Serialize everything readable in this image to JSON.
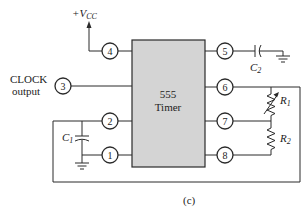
{
  "figure": {
    "caption": "(c)",
    "chip": {
      "line1": "555",
      "line2": "Timer",
      "fill_color": "#d4d4d4"
    },
    "supply": {
      "label_prefix": "+V",
      "label_sub": "CC"
    },
    "clock_label": {
      "line1": "CLOCK",
      "line2": "output"
    },
    "pins": {
      "p1": "1",
      "p2": "2",
      "p3": "3",
      "p4": "4",
      "p5": "5",
      "p6": "6",
      "p7": "7",
      "p8": "8"
    },
    "components": {
      "c1": {
        "letter": "C",
        "sub": "1"
      },
      "c2": {
        "letter": "C",
        "sub": "2"
      },
      "r1": {
        "letter": "R",
        "sub": "1",
        "type": "variable-resistor"
      },
      "r2": {
        "letter": "R",
        "sub": "2",
        "type": "resistor"
      }
    }
  }
}
